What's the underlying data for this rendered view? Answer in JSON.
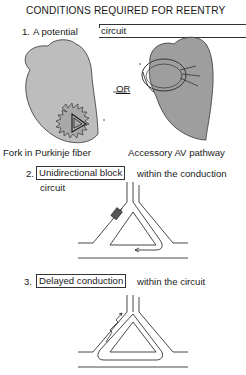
{
  "title": "CONDITIONS REQUIRED FOR REENTRY",
  "items": [
    {
      "number": "1.",
      "pre": "A potential",
      "boxed": "circuit",
      "post": ""
    },
    {
      "number": "2.",
      "pre": "",
      "boxed": "Unidirectional block",
      "post": "within the conduction",
      "post2": "circuit"
    },
    {
      "number": "3.",
      "pre": "",
      "boxed": "Delayed conduction",
      "post": "within the circuit"
    }
  ],
  "separator": "OR",
  "captions": {
    "left": "Fork in Purkinje fiber",
    "right": "Accessory AV pathway"
  },
  "colors": {
    "heart_fill": "#bdbdbd",
    "heart_fill_dark": "#9a9a9a",
    "line": "#333333",
    "block": "#555555"
  }
}
